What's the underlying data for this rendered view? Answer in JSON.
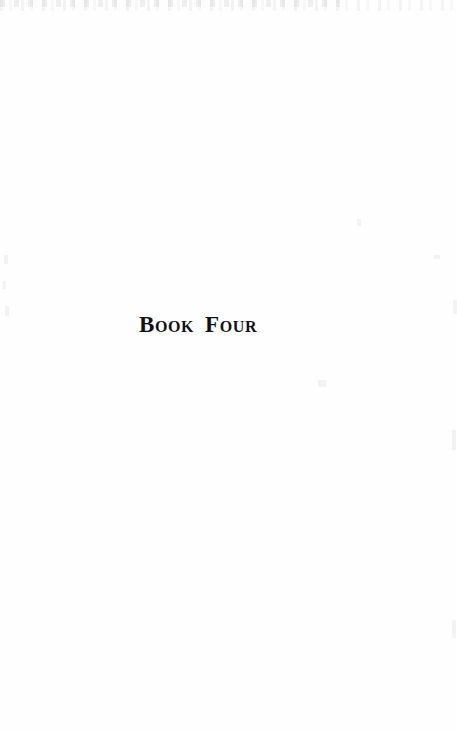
{
  "page": {
    "kind": "book-part-title-page",
    "background_color": "#fefefe",
    "width": 457,
    "height": 730
  },
  "part_title": {
    "full_text": "BOOK FOUR",
    "word_one": "Book",
    "word_two": "Four",
    "text_color": "#121212"
  }
}
